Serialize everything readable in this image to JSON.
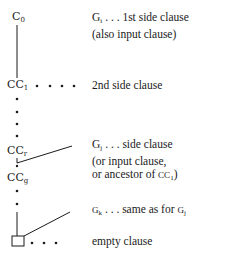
{
  "diagram": {
    "type": "resolution-derivation-tree",
    "nodes": [
      {
        "id": "c0",
        "base": "C",
        "sub": "0"
      },
      {
        "id": "cc1",
        "base": "CC",
        "sub": "1"
      },
      {
        "id": "ccr",
        "base": "CC",
        "sub": "r"
      },
      {
        "id": "ccg",
        "base": "CC",
        "sub": "g"
      },
      {
        "id": "empty",
        "base": "",
        "sub": "",
        "shape": "square"
      }
    ],
    "labels": [
      {
        "id": "gi",
        "base": "G",
        "sub": "i",
        "lines": [
          " . . . 1st side clause",
          "(also input clause)"
        ]
      },
      {
        "id": "second",
        "lines": [
          "2nd side clause"
        ]
      },
      {
        "id": "gj",
        "base": "G",
        "sub": "j",
        "lines": [
          " . . . side clause",
          "(or input clause,",
          "or ancestor of "
        ],
        "ancestor_ref": {
          "base": "CC",
          "sub": "1",
          "close": ")"
        }
      },
      {
        "id": "gk",
        "base": "G",
        "sub": "k",
        "lines": [
          " . . . same as for "
        ],
        "ref": {
          "base": "G",
          "sub": "j"
        }
      },
      {
        "id": "empty_label",
        "lines": [
          "empty clause"
        ]
      }
    ],
    "colors": {
      "ink": "#1a1a1a",
      "background": "#ffffff"
    }
  }
}
